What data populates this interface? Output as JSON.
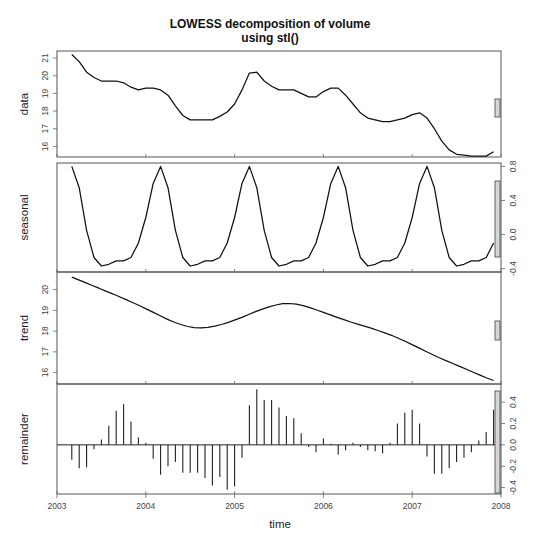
{
  "chart_data": {
    "type": "line",
    "title": "LOWESS decomposition of volume",
    "subtitle": "using stl()",
    "xlabel": "time",
    "x_ticks": [
      "2003",
      "2004",
      "2005",
      "2006",
      "2007",
      "2008"
    ],
    "x_range": [
      2003,
      2008
    ],
    "x_start": 2003.1667,
    "x_step": 0.08333,
    "panels": [
      {
        "name": "data",
        "ylabel": "data",
        "type": "line",
        "axis_side": "left",
        "ticks": [
          16,
          17,
          18,
          19,
          20,
          21
        ],
        "tick_labels": [
          "16",
          "17",
          "18",
          "19",
          "20",
          "21"
        ],
        "ylim": [
          15.4,
          21.4
        ],
        "values": [
          21.2,
          20.8,
          20.2,
          19.9,
          19.7,
          19.7,
          19.7,
          19.6,
          19.35,
          19.2,
          19.3,
          19.3,
          19.2,
          18.9,
          18.3,
          17.75,
          17.5,
          17.5,
          17.5,
          17.5,
          17.7,
          17.95,
          18.4,
          19.2,
          20.15,
          20.2,
          19.7,
          19.4,
          19.2,
          19.2,
          19.2,
          19.0,
          18.8,
          18.8,
          19.1,
          19.3,
          19.3,
          18.9,
          18.4,
          17.9,
          17.6,
          17.5,
          17.4,
          17.4,
          17.5,
          17.6,
          17.8,
          17.9,
          17.6,
          17.0,
          16.3,
          15.8,
          15.55,
          15.5,
          15.45,
          15.45,
          15.45,
          15.7
        ],
        "scale_bar": {
          "y_top": 99,
          "y_bottom": 117
        }
      },
      {
        "name": "seasonal",
        "ylabel": "seasonal",
        "type": "line",
        "axis_side": "right",
        "ticks": [
          -0.4,
          0.0,
          0.4,
          0.8
        ],
        "tick_labels": [
          "-0.4",
          "0.0",
          "0.4",
          "0.8"
        ],
        "ylim": [
          -0.44,
          0.84
        ],
        "values": [
          0.8,
          0.55,
          0.05,
          -0.27,
          -0.37,
          -0.35,
          -0.31,
          -0.31,
          -0.27,
          -0.1,
          0.2,
          0.6,
          0.8,
          0.55,
          0.05,
          -0.27,
          -0.37,
          -0.35,
          -0.31,
          -0.31,
          -0.27,
          -0.1,
          0.2,
          0.6,
          0.8,
          0.55,
          0.05,
          -0.27,
          -0.37,
          -0.35,
          -0.31,
          -0.31,
          -0.27,
          -0.1,
          0.2,
          0.6,
          0.8,
          0.55,
          0.05,
          -0.27,
          -0.37,
          -0.35,
          -0.31,
          -0.31,
          -0.27,
          -0.1,
          0.2,
          0.6,
          0.8,
          0.55,
          0.05,
          -0.27,
          -0.37,
          -0.35,
          -0.31,
          -0.31,
          -0.27,
          -0.1
        ],
        "scale_bar": {
          "y_top": 181,
          "y_bottom": 257
        }
      },
      {
        "name": "trend",
        "ylabel": "trend",
        "type": "line",
        "axis_side": "left",
        "ticks": [
          16,
          17,
          18,
          19,
          20
        ],
        "tick_labels": [
          "16",
          "17",
          "18",
          "19",
          "20"
        ],
        "ylim": [
          15.45,
          20.85
        ],
        "values": [
          20.6,
          20.47,
          20.34,
          20.2,
          20.07,
          19.93,
          19.8,
          19.66,
          19.52,
          19.37,
          19.22,
          19.06,
          18.9,
          18.74,
          18.58,
          18.44,
          18.32,
          18.22,
          18.17,
          18.16,
          18.18,
          18.24,
          18.32,
          18.42,
          18.54,
          18.66,
          18.8,
          18.94,
          19.06,
          19.17,
          19.26,
          19.32,
          19.33,
          19.3,
          19.23,
          19.13,
          19.02,
          18.9,
          18.78,
          18.66,
          18.55,
          18.44,
          18.34,
          18.24,
          18.14,
          18.03,
          17.92,
          17.8,
          17.66,
          17.51,
          17.35,
          17.19,
          17.03,
          16.87,
          16.72,
          16.58,
          16.44,
          16.3,
          16.16,
          16.02,
          15.88,
          15.74,
          15.62
        ],
        "scale_bar": {
          "y_top": 321,
          "y_bottom": 340
        }
      },
      {
        "name": "remainder",
        "ylabel": "remainder",
        "type": "bar",
        "axis_side": "right",
        "ticks": [
          -0.4,
          -0.2,
          0.0,
          0.2,
          0.4
        ],
        "tick_labels": [
          "-0.4",
          "-0.2",
          "0.0",
          "0.2",
          "0.4"
        ],
        "ylim": [
          -0.46,
          0.57
        ],
        "values": [
          -0.14,
          -0.22,
          -0.21,
          -0.04,
          0.05,
          0.18,
          0.32,
          0.38,
          0.22,
          0.07,
          0.02,
          -0.13,
          -0.28,
          -0.2,
          -0.16,
          -0.26,
          -0.26,
          -0.26,
          -0.31,
          -0.38,
          -0.3,
          -0.42,
          -0.39,
          -0.12,
          0.37,
          0.52,
          0.42,
          0.42,
          0.35,
          0.27,
          0.25,
          0.11,
          -0.02,
          -0.07,
          0.06,
          0.01,
          -0.09,
          -0.05,
          0.02,
          -0.02,
          -0.05,
          -0.06,
          -0.08,
          0.02,
          0.2,
          0.3,
          0.33,
          0.2,
          -0.11,
          -0.27,
          -0.27,
          -0.22,
          -0.16,
          -0.12,
          -0.07,
          0.04,
          0.12,
          0.33
        ],
        "scale_bar": {
          "y_top": 391,
          "y_bottom": 493
        }
      }
    ]
  }
}
